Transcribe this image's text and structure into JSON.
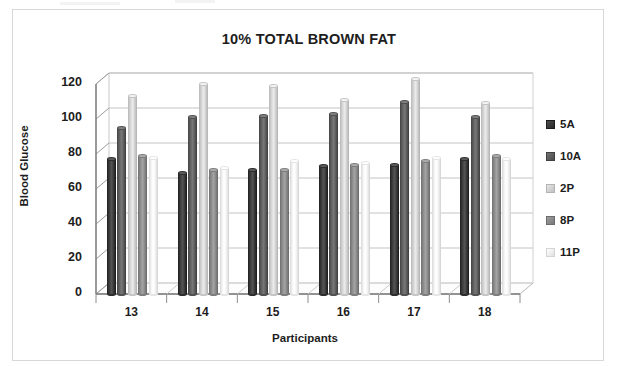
{
  "frame": {
    "border_color": "#d8d8d8"
  },
  "chart_data": {
    "type": "bar",
    "title": "10% TOTAL BROWN FAT",
    "xlabel": "Participants",
    "ylabel": "Blood Glucose",
    "categories": [
      "13",
      "14",
      "15",
      "16",
      "17",
      "18"
    ],
    "yticks": [
      0,
      20,
      40,
      60,
      80,
      100,
      120
    ],
    "ylim": [
      0,
      120
    ],
    "grid": true,
    "legend_position": "right",
    "style": "3d-cylinder",
    "series": [
      {
        "name": "5A",
        "color": "#3a3a3a",
        "values": [
          77,
          69,
          71,
          73,
          74,
          77
        ]
      },
      {
        "name": "10A",
        "color": "#5e5e5e",
        "values": [
          95,
          101,
          102,
          103,
          110,
          101
        ]
      },
      {
        "name": "2P",
        "color": "#d2d2d2",
        "values": [
          113,
          120,
          119,
          111,
          123,
          109
        ]
      },
      {
        "name": "8P",
        "color": "#8a8a8a",
        "values": [
          79,
          71,
          71,
          74,
          76,
          79
        ]
      },
      {
        "name": "11P",
        "color": "#f2f2f2",
        "values": [
          78,
          72,
          76,
          75,
          78,
          77
        ]
      }
    ]
  }
}
